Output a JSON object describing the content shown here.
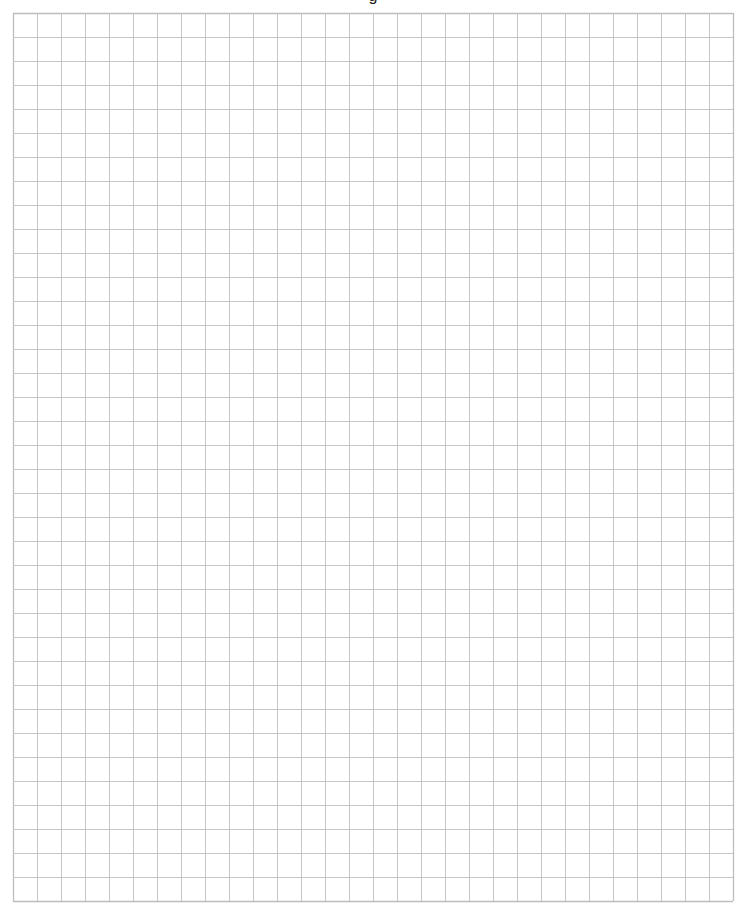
{
  "page": {
    "type": "graph-paper",
    "title_fragment": "g",
    "grid": {
      "columns": 30,
      "rows": 37,
      "line_color": "#c6c6c6",
      "border_color": "#bdbdbd",
      "background": "#ffffff"
    }
  }
}
